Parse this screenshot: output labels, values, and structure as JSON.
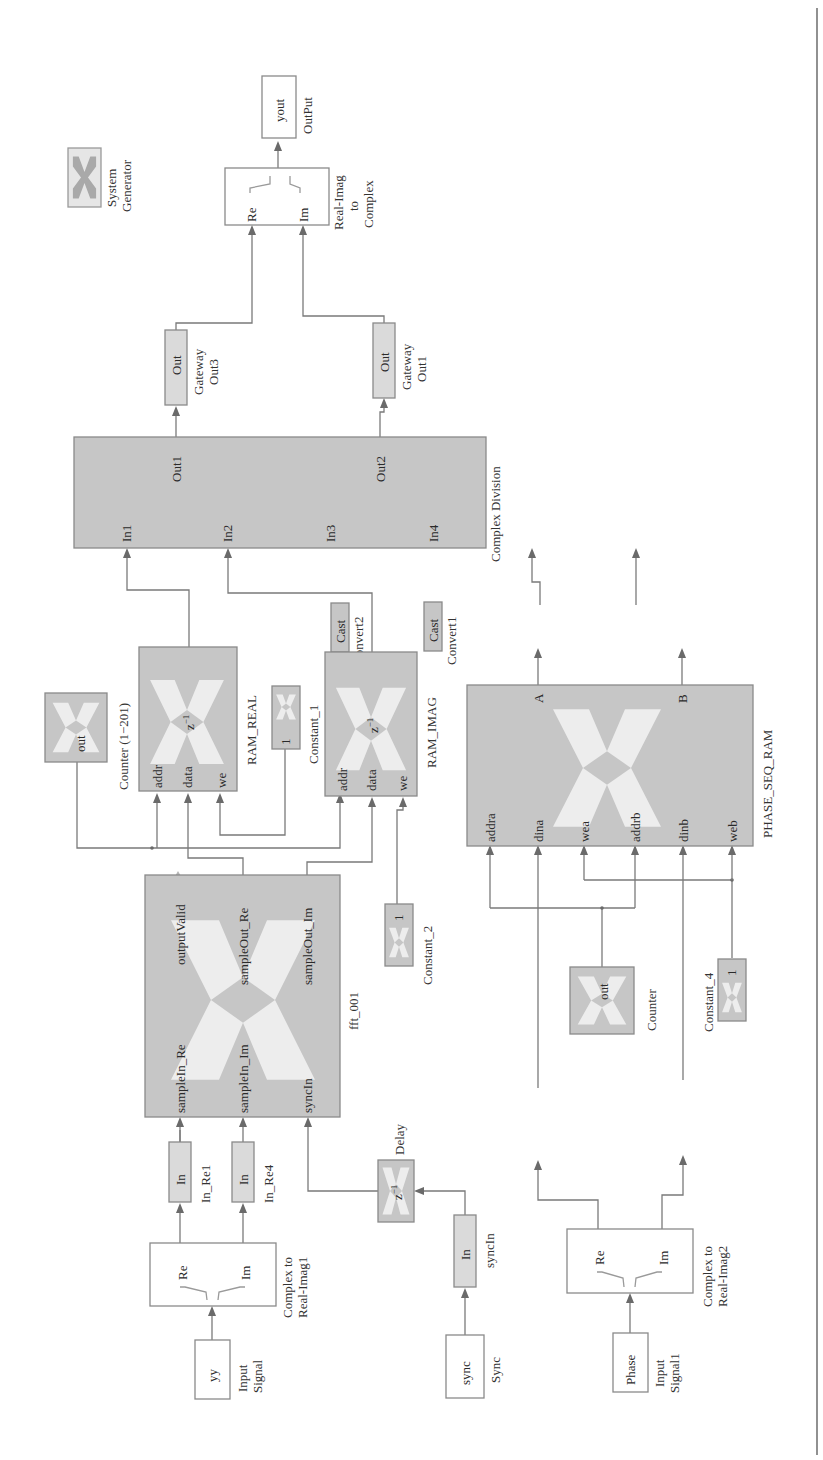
{
  "diagram": {
    "type": "Xilinx System Generator / Simulink model (rotated 90° CCW)",
    "orientation": "rotated-90-ccw",
    "colors": {
      "block_gray": "#c6c6c6",
      "block_light": "#dadada",
      "wire": "#7a7a7a",
      "text": "#333333"
    }
  },
  "blocks": {
    "system_generator": {
      "label_line1": "System",
      "label_line2": "Generator"
    },
    "output": {
      "text": "yout",
      "label": "OutPut"
    },
    "real_imag_to_complex": {
      "label_line1": "Real-Imag",
      "label_line2": "to",
      "label_line3": "Complex",
      "port_re": "Re",
      "port_im": "Im"
    },
    "gateway_out3": {
      "text": "Out",
      "label_line1": "Gateway",
      "label_line2": "Out3"
    },
    "gateway_out1": {
      "text": "Out",
      "label_line1": "Gateway",
      "label_line2": "Out1"
    },
    "complex_division": {
      "label": "Complex Division",
      "in1": "In1",
      "in2": "In2",
      "in3": "In3",
      "in4": "In4",
      "out1": "Out1",
      "out2": "Out2"
    },
    "convert2": {
      "text": "Cast",
      "label": "Convert2"
    },
    "convert1": {
      "text": "Cast",
      "label": "Convert1"
    },
    "counter_1_201": {
      "text": "out",
      "label": "Counter (1−201)"
    },
    "ram_real": {
      "label": "RAM_REAL",
      "delay": "z",
      "delay_exp": "−1",
      "port_addr": "addr",
      "port_data": "data",
      "port_we": "we"
    },
    "constant_1": {
      "text": "1",
      "label": "Constant_1"
    },
    "ram_imag": {
      "label": "RAM_IMAG",
      "delay": "z",
      "delay_exp": "−1",
      "port_addr": "addr",
      "port_data": "data",
      "port_we": "we"
    },
    "phase_seq_ram": {
      "label": "PHASE_SEQ_RAM",
      "port_addra": "addra",
      "port_dina": "dina",
      "port_wea": "wea",
      "port_addrb": "addrb",
      "port_dinb": "dinb",
      "port_web": "web",
      "out_a": "A",
      "out_b": "B"
    },
    "fft_001": {
      "label": "fft_001",
      "in_re": "sampleIn_Re",
      "in_im": "sampleIn_Im",
      "sync_in": "syncIn",
      "output_valid": "outputValid",
      "out_re": "sampleOut_Re",
      "out_im": "sampleOut_Im"
    },
    "constant_2": {
      "text": "1",
      "label": "Constant_2"
    },
    "counter": {
      "text": "out",
      "label": "Counter"
    },
    "constant_4": {
      "text": "1",
      "label": "Constant_4"
    },
    "in_re1": {
      "text": "In",
      "label": "In_Re1"
    },
    "in_re4": {
      "text": "In",
      "label": "In_Re4"
    },
    "delay": {
      "label": "Delay",
      "delay": "z",
      "delay_exp": "−1"
    },
    "in_re2": {
      "text": "In",
      "label": "In_Re2"
    },
    "in_re3": {
      "text": "In",
      "label": "In_Re3"
    },
    "complex_to_real_imag1": {
      "label_line1": "Complex to",
      "label_line2": "Real-Imag1",
      "port_re": "Re",
      "port_im": "Im"
    },
    "syncin_gateway": {
      "text": "In",
      "label": "syncIn"
    },
    "complex_to_real_imag2": {
      "label_line1": "Complex to",
      "label_line2": "Real-Imag2",
      "port_re": "Re",
      "port_im": "Im"
    },
    "input_signal": {
      "text": "yy",
      "label_line1": "Input",
      "label_line2": "Signal"
    },
    "sync": {
      "text": "sync",
      "label": "Sync"
    },
    "input_signal1": {
      "text": "Phase",
      "label_line1": "Input",
      "label_line2": "Signal1"
    }
  }
}
